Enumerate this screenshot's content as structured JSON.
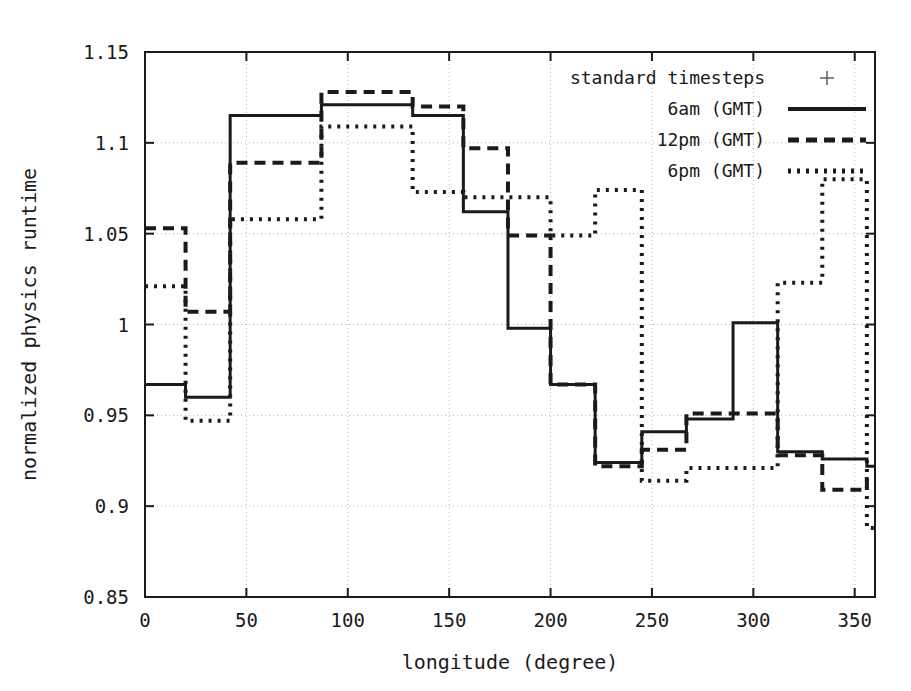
{
  "chart_data": {
    "type": "line",
    "title": "",
    "xlabel": "longitude (degree)",
    "ylabel": "normalized physics runtime",
    "xlim": [
      0,
      360
    ],
    "ylim": [
      0.85,
      1.15
    ],
    "xticks": [
      0,
      50,
      100,
      150,
      200,
      250,
      300,
      350
    ],
    "xtick_labels": [
      "0",
      "50",
      "100",
      "150",
      "200",
      "250",
      "300",
      "350"
    ],
    "yticks": [
      0.85,
      0.9,
      0.95,
      1.0,
      1.05,
      1.1,
      1.15
    ],
    "ytick_labels": [
      "0.85",
      "0.9",
      "0.95",
      "1",
      "1.05",
      "1.1",
      "1.15"
    ],
    "grid": true,
    "drawstyle": "steps-post",
    "bin_edges": [
      0,
      20,
      42,
      65,
      87,
      110,
      132,
      157,
      179,
      200,
      222,
      245,
      267,
      290,
      312,
      334,
      356
    ],
    "legend_position": "top-right",
    "series": [
      {
        "name": "standard timesteps",
        "style": "marker",
        "marker": "+",
        "values": []
      },
      {
        "name": "6am (GMT)",
        "style": "solid",
        "values": [
          0.967,
          0.96,
          1.115,
          1.115,
          1.121,
          1.121,
          1.115,
          1.062,
          0.998,
          0.967,
          0.924,
          0.941,
          0.948,
          1.001,
          0.93,
          0.926,
          0.922
        ]
      },
      {
        "name": "12pm (GMT)",
        "style": "dashed",
        "values": [
          1.053,
          1.007,
          1.089,
          1.089,
          1.128,
          1.128,
          1.12,
          1.097,
          1.049,
          0.967,
          0.922,
          0.931,
          0.951,
          0.951,
          0.928,
          0.909,
          0.915
        ]
      },
      {
        "name": "6pm (GMT)",
        "style": "dotted",
        "values": [
          1.021,
          0.947,
          1.058,
          1.058,
          1.109,
          1.109,
          1.073,
          1.07,
          1.07,
          1.049,
          1.074,
          0.914,
          0.921,
          0.921,
          1.023,
          1.08,
          0.888
        ]
      }
    ]
  },
  "legend": {
    "entries": [
      {
        "label": "standard timesteps",
        "key": "plus-marker"
      },
      {
        "label": "6am (GMT)",
        "key": "solid-line"
      },
      {
        "label": "12pm (GMT)",
        "key": "dashed-line"
      },
      {
        "label": "6pm (GMT)",
        "key": "dotted-line"
      }
    ]
  },
  "axes": {
    "x_title": "longitude (degree)",
    "y_title": "normalized physics runtime"
  },
  "colors": {
    "line": "#1a1a1a",
    "grid": "#b4b4b4",
    "frame": "#1a1a1a",
    "background": "#ffffff"
  }
}
